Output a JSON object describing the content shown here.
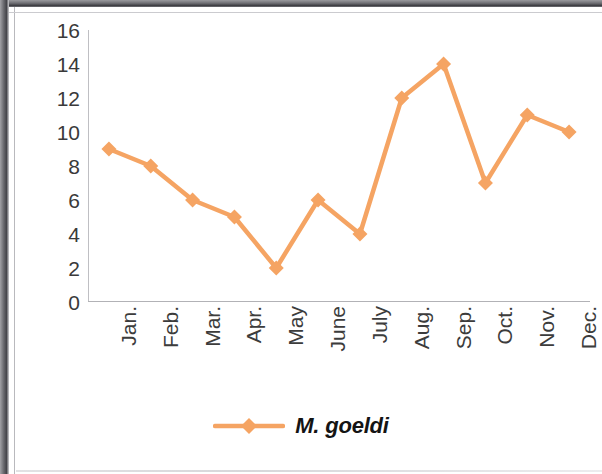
{
  "chart_data": {
    "type": "line",
    "title": "",
    "xlabel": "",
    "ylabel": "",
    "categories": [
      "Jan.",
      "Feb.",
      "Mar.",
      "Apr.",
      "May",
      "June",
      "July",
      "Aug.",
      "Sep.",
      "Oct.",
      "Nov.",
      "Dec."
    ],
    "series": [
      {
        "name": "M. goeldi",
        "values": [
          9,
          8,
          6,
          5,
          2,
          6,
          4,
          12,
          14,
          7,
          11,
          10
        ],
        "color": "#F5A463",
        "marker": "diamond"
      }
    ],
    "ylim": [
      0,
      16
    ],
    "ytick_step": 2,
    "yticks": [
      "16",
      "14",
      "12",
      "10",
      "8",
      "6",
      "4",
      "2",
      "0"
    ],
    "grid": false,
    "legend_position": "bottom"
  },
  "legend": {
    "entries": [
      {
        "label": "M. goeldi",
        "color": "#F5A463"
      }
    ]
  },
  "axes": {
    "y_axis_color": "#bfbfc3",
    "x_axis_color": "#b2b2b6"
  }
}
